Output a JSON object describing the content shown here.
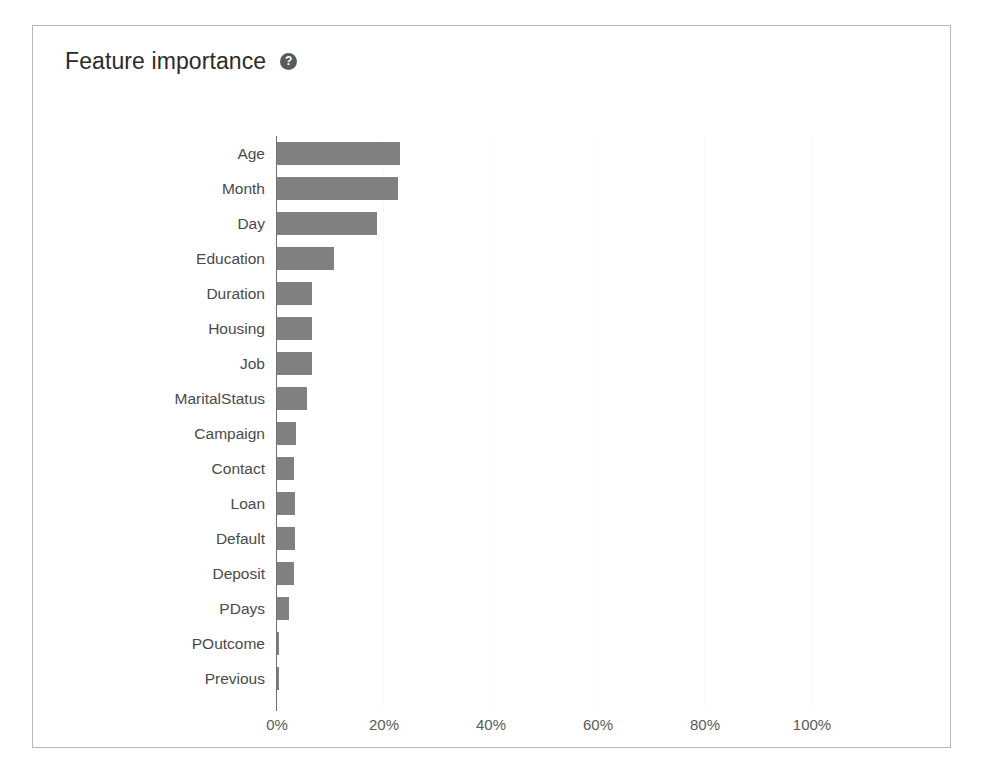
{
  "card": {
    "title": "Feature importance",
    "help_icon": "help-circle-icon",
    "help_glyph": "?"
  },
  "colors": {
    "bar": "#808080",
    "axis": "#6f6f6f",
    "border": "#b9b9b9",
    "title_text": "#2b2b2b",
    "label_text": "#4a4a4a",
    "tick_text": "#5a5a5a",
    "gridline": "#fafafa",
    "help_icon_bg": "#555b5e"
  },
  "chart_data": {
    "type": "bar",
    "orientation": "horizontal",
    "title": "Feature importance",
    "xlabel": "",
    "ylabel": "",
    "xlim": [
      0,
      100
    ],
    "grid": true,
    "legend": null,
    "tick_labels": [
      "0%",
      "20%",
      "40%",
      "60%",
      "80%",
      "100%"
    ],
    "ticks": [
      0,
      20,
      40,
      60,
      80,
      100
    ],
    "value_format": "percent",
    "categories": [
      "Age",
      "Month",
      "Day",
      "Education",
      "Duration",
      "Housing",
      "Job",
      "MaritalStatus",
      "Campaign",
      "Contact",
      "Loan",
      "Default",
      "Deposit",
      "PDays",
      "POutcome",
      "Previous"
    ],
    "values": [
      23.0,
      22.6,
      18.7,
      10.7,
      6.6,
      6.5,
      6.5,
      5.6,
      3.5,
      3.2,
      3.4,
      3.4,
      3.2,
      2.2,
      0.4,
      0.3
    ]
  }
}
